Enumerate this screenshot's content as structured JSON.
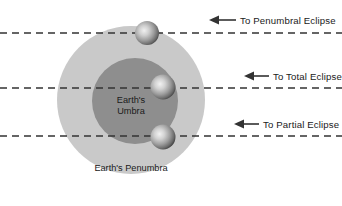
{
  "diagram": {
    "canvas": {
      "width": 342,
      "height": 206,
      "background": "#ffffff"
    },
    "regions": [
      {
        "name": "penumbra",
        "label": "Earth's Penumbra",
        "color": "#c9c9c9",
        "cx": 131,
        "cy": 100,
        "r": 74,
        "label_x": 131,
        "label_y": 171
      },
      {
        "name": "umbra",
        "label_line1": "Earth's",
        "label_line2": "Umbra",
        "color": "#8e8e8e",
        "cx": 135,
        "cy": 101,
        "r": 43,
        "label_x": 131,
        "label_y": 103
      }
    ],
    "moons": [
      {
        "name": "moon-penumbral",
        "cx": 147,
        "cy": 33,
        "r": 12,
        "highlight": "#e8e8e8",
        "mid": "#a0a0a0",
        "edge": "#4a4a4a"
      },
      {
        "name": "moon-total",
        "cx": 163,
        "cy": 87,
        "r": 12.5,
        "highlight": "#eaeaea",
        "mid": "#a2a2a2",
        "edge": "#4a4a4a"
      },
      {
        "name": "moon-partial",
        "cx": 163,
        "cy": 137,
        "r": 12.5,
        "highlight": "#eaeaea",
        "mid": "#a2a2a2",
        "edge": "#4a4a4a"
      }
    ],
    "sight_lines": [
      {
        "name": "penumbral-eclipse",
        "label": "To Penumbral Eclipse",
        "y": 33,
        "dash_x_start": 0,
        "dash_x_end": 342,
        "arrow_tip_x": 210,
        "arrow_tail_x": 235,
        "arrow_y": 20,
        "label_x": 240,
        "label_y": 23.5,
        "color": "#333333"
      },
      {
        "name": "total-eclipse",
        "label": "To Total Eclipse",
        "y": 88,
        "dash_x_start": 0,
        "dash_x_end": 342,
        "arrow_tip_x": 245,
        "arrow_tail_x": 268,
        "arrow_y": 76,
        "label_x": 272,
        "label_y": 79.5,
        "color": "#333333"
      },
      {
        "name": "partial-eclipse",
        "label": "To Partial Eclipse",
        "y": 136,
        "dash_x_start": 0,
        "dash_x_end": 342,
        "arrow_tip_x": 235,
        "arrow_tail_x": 258,
        "arrow_y": 124,
        "label_x": 262,
        "label_y": 127.5,
        "color": "#333333"
      }
    ],
    "style": {
      "dash_pattern": "7 5",
      "dash_width": 1.6,
      "arrow_line_width": 1.6
    }
  }
}
